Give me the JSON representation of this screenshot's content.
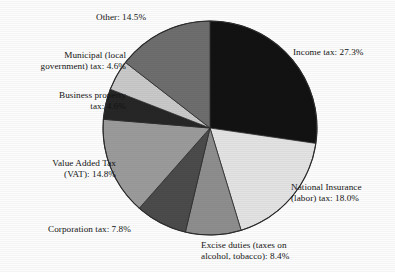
{
  "chart_data": {
    "type": "pie",
    "title": "",
    "subtitle": "",
    "xlabel": "",
    "ylabel": "",
    "legend_position": "none",
    "grid": false,
    "start_angle_deg": 0,
    "direction": "clockwise",
    "value_unit": "percent",
    "categories": [
      "Income tax",
      "National Insurance (labor) tax",
      "Excise duties (taxes on alcohol, tobacco)",
      "Corporation tax",
      "Value Added Tax (VAT)",
      "Business property tax",
      "Municipal (local government) tax",
      "Other"
    ],
    "values": [
      27.3,
      18.0,
      8.4,
      7.8,
      14.8,
      4.6,
      4.6,
      14.5
    ],
    "slices": [
      {
        "name": "Income tax",
        "value": 27.3,
        "color": "#121212",
        "label": "Income tax: 27.3%"
      },
      {
        "name": "National Insurance (labor) tax",
        "value": 18.0,
        "color": "#e3e3e3",
        "label": "National Insurance\n(labor) tax: 18.0%"
      },
      {
        "name": "Excise duties",
        "value": 8.4,
        "color": "#8e8e8e",
        "label": "Excise duties (taxes on\nalcohol, tobacco): 8.4%"
      },
      {
        "name": "Corporation tax",
        "value": 7.8,
        "color": "#4b4b4b",
        "label": "Corporation tax: 7.8%"
      },
      {
        "name": "Value Added Tax (VAT)",
        "value": 14.8,
        "color": "#9b9b9b",
        "label": "Value Added Tax\n(VAT): 14.8%"
      },
      {
        "name": "Business property tax",
        "value": 4.6,
        "color": "#262626",
        "label": "Business property\ntax: 4.6%"
      },
      {
        "name": "Municipal (local government) tax",
        "value": 4.6,
        "color": "#c9c9c9",
        "label": "Municipal (local\ngovernment) tax: 4.6%"
      },
      {
        "name": "Other",
        "value": 14.5,
        "color": "#6e6e6e",
        "label": "Other: 14.5%"
      }
    ]
  },
  "labels": {
    "income": "Income tax: 27.3%",
    "national_insurance": "National Insurance\n(labor) tax: 18.0%",
    "excise": "Excise duties (taxes on\nalcohol, tobacco): 8.4%",
    "corporation": "Corporation tax: 7.8%",
    "vat": "Value Added Tax\n(VAT): 14.8%",
    "business_property": "Business property\ntax: 4.6%",
    "municipal": "Municipal (local\ngovernment) tax: 4.6%",
    "other": "Other: 14.5%"
  },
  "geometry": {
    "center_x": 210,
    "center_y": 128,
    "radius": 107
  },
  "colors": {
    "background": "#ffffff",
    "outline": "#2b2b2b",
    "text": "#141414"
  }
}
